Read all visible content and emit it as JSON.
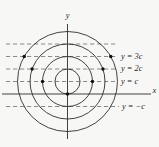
{
  "figure": {
    "axis_labels": {
      "x": "x",
      "y": "y"
    },
    "line_labels": {
      "y3c": "y = 3c",
      "y2c": "y = 2c",
      "yc": "y = c",
      "yminusc": "y = −c"
    },
    "colors": {
      "background": "#f7f7f5",
      "curve": "#2e2e2e",
      "dashed_line": "#8a8a8a",
      "dot": "#111111",
      "label_text": "#1f1f1f"
    }
  }
}
